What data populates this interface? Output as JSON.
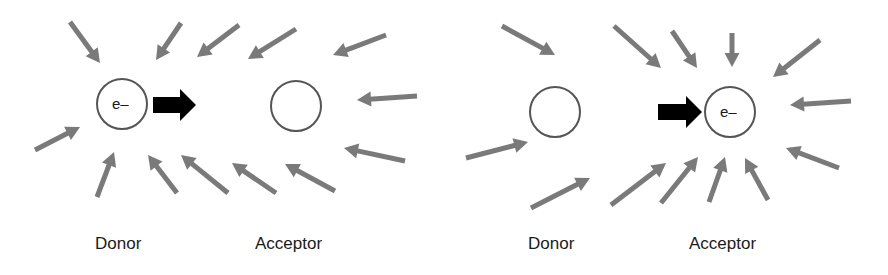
{
  "panels": [
    {
      "donor": {
        "label": "Donor",
        "cx": 122,
        "cy": 104,
        "content": "e–"
      },
      "acceptor": {
        "label": "Acceptor",
        "cx": 296,
        "cy": 106,
        "content": ""
      },
      "transfer_arrow": {
        "x1": 153,
        "x2": 196,
        "y": 105
      },
      "field_arrows": [
        [
          70,
          22,
          100,
          63
        ],
        [
          181,
          23,
          156,
          60
        ],
        [
          239,
          25,
          197,
          57
        ],
        [
          296,
          29,
          248,
          59
        ],
        [
          386,
          35,
          333,
          55
        ],
        [
          417,
          96,
          357,
          100
        ],
        [
          405,
          161,
          344,
          148
        ],
        [
          335,
          191,
          285,
          164
        ],
        [
          276,
          193,
          232,
          163
        ],
        [
          228,
          193,
          181,
          155
        ],
        [
          177,
          193,
          148,
          155
        ],
        [
          97,
          197,
          114,
          152
        ],
        [
          35,
          150,
          80,
          127
        ]
      ]
    },
    {
      "donor": {
        "label": "Donor",
        "cx": 555,
        "cy": 112,
        "content": ""
      },
      "acceptor": {
        "label": "Acceptor",
        "cx": 730,
        "cy": 112,
        "content": "e–"
      },
      "transfer_arrow": {
        "x1": 658,
        "x2": 702,
        "y": 112
      },
      "field_arrows": [
        [
          502,
          26,
          555,
          55
        ],
        [
          614,
          26,
          661,
          68
        ],
        [
          672,
          31,
          697,
          68
        ],
        [
          732,
          33,
          732,
          67
        ],
        [
          820,
          40,
          773,
          77
        ],
        [
          851,
          101,
          790,
          105
        ],
        [
          839,
          168,
          786,
          148
        ],
        [
          768,
          200,
          745,
          158
        ],
        [
          709,
          202,
          725,
          157
        ],
        [
          661,
          203,
          698,
          157
        ],
        [
          611,
          205,
          666,
          163
        ],
        [
          531,
          208,
          590,
          178
        ],
        [
          466,
          158,
          528,
          142
        ]
      ]
    }
  ],
  "colors": {
    "field_arrow": "#7a7a7a",
    "transfer_arrow": "#000000",
    "circle": "#555555"
  }
}
